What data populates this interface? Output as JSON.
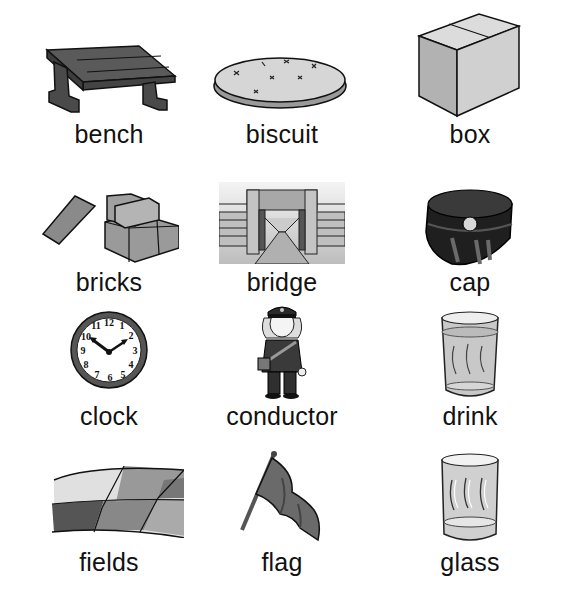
{
  "sheet": {
    "rows": [
      [
        {
          "word": "bench",
          "icon": "bench-icon"
        },
        {
          "word": "biscuit",
          "icon": "biscuit-icon"
        },
        {
          "word": "box",
          "icon": "box-icon"
        }
      ],
      [
        {
          "word": "bricks",
          "icon": "bricks-icon"
        },
        {
          "word": "bridge",
          "icon": "bridge-icon"
        },
        {
          "word": "cap",
          "icon": "cap-icon"
        }
      ],
      [
        {
          "word": "clock",
          "icon": "clock-icon"
        },
        {
          "word": "conductor",
          "icon": "conductor-icon"
        },
        {
          "word": "drink",
          "icon": "drink-icon"
        }
      ],
      [
        {
          "word": "fields",
          "icon": "fields-icon"
        },
        {
          "word": "flag",
          "icon": "flag-icon"
        },
        {
          "word": "glass",
          "icon": "glass-icon"
        }
      ]
    ],
    "clock_numbers": [
      "12",
      "1",
      "2",
      "3",
      "4",
      "5",
      "6",
      "7",
      "8",
      "9",
      "10",
      "11"
    ]
  }
}
